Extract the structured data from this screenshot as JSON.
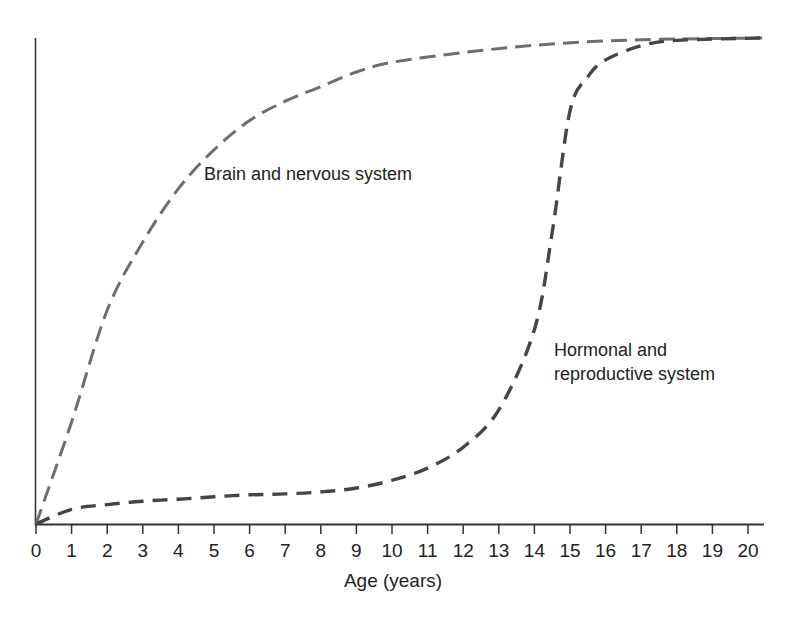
{
  "chart_data": {
    "type": "line",
    "title": "",
    "xlabel": "Age (years)",
    "ylabel": "",
    "xlim": [
      0,
      20.4
    ],
    "ylim": [
      0,
      100
    ],
    "x_ticks": [
      0,
      1,
      2,
      3,
      4,
      5,
      6,
      7,
      8,
      9,
      10,
      11,
      12,
      13,
      14,
      15,
      16,
      17,
      18,
      19,
      20
    ],
    "y_ticks": [],
    "grid": false,
    "legend": "none (curves labeled inline)",
    "line_style": "dashed",
    "series": [
      {
        "name": "Brain and nervous system",
        "color": "#6e6e6e",
        "x": [
          0,
          1,
          2,
          3,
          4,
          5,
          6,
          7,
          8,
          9,
          10,
          12,
          14,
          16,
          18,
          20.4
        ],
        "y": [
          0,
          21,
          44,
          58,
          69,
          77,
          83,
          87,
          90,
          93,
          95,
          97,
          98.5,
          99.4,
          99.8,
          100
        ]
      },
      {
        "name": "Hormonal and reproductive system",
        "color": "#454545",
        "x": [
          0,
          1,
          2,
          3,
          4,
          5,
          6,
          7,
          8,
          9,
          10,
          11,
          12,
          13,
          14,
          14.5,
          15,
          15.5,
          16,
          17,
          18,
          20.4
        ],
        "y": [
          0,
          3,
          4,
          4.7,
          5.1,
          5.6,
          6,
          6.2,
          6.6,
          7.4,
          9,
          11.5,
          15.8,
          23.5,
          40,
          60,
          85,
          92,
          95.5,
          98.4,
          99.5,
          100
        ]
      }
    ],
    "annotations": [
      {
        "text": "Brain and nervous system",
        "x": 4.7,
        "y": 72
      },
      {
        "text": "Hormonal and reproductive system",
        "lines": [
          "Hormonal and",
          "reproductive system"
        ],
        "x": 14.5,
        "y": 36
      }
    ]
  },
  "labels": {
    "xlabel": "Age (years)",
    "brain": "Brain and nervous system",
    "hormonal_line1": "Hormonal and",
    "hormonal_line2": "reproductive system"
  }
}
